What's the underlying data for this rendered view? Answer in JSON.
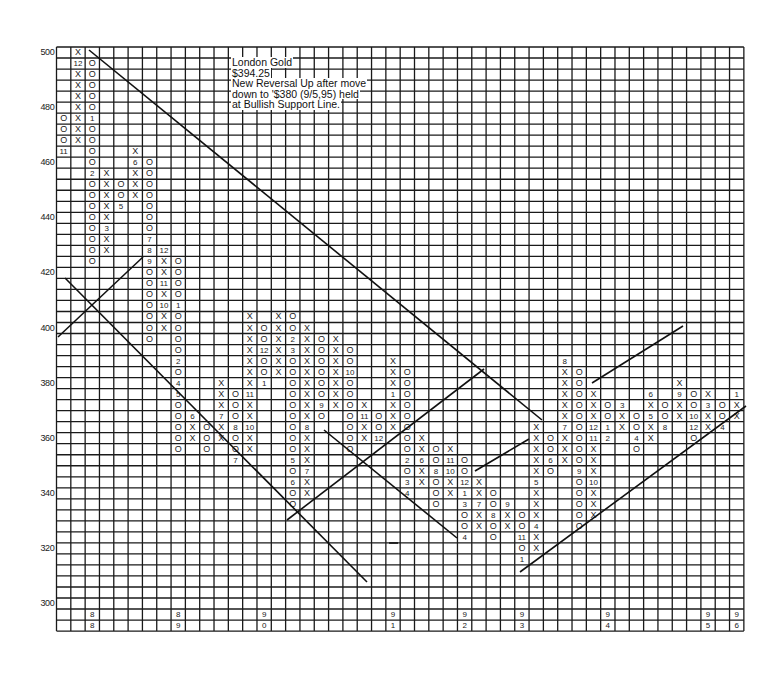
{
  "chart_data": {
    "type": "point-and-figure",
    "title": "London Gold",
    "annotation": {
      "lines": [
        "London Gold",
        "$394.25",
        "New Reversal Up after move",
        "down to '$380 (9/5,95) held",
        "at Bullish Support Line."
      ]
    },
    "box_size": 4,
    "y_axis": {
      "max": 500,
      "min": 300,
      "ticks": [
        {
          "label": "500",
          "row": 0
        },
        {
          "label": "480",
          "row": 5
        },
        {
          "label": "460",
          "row": 10
        },
        {
          "label": "440",
          "row": 15
        },
        {
          "label": "420",
          "row": 20
        },
        {
          "label": "400",
          "row": 25
        },
        {
          "label": "380",
          "row": 30
        },
        {
          "label": "360",
          "row": 35
        },
        {
          "label": "340",
          "row": 40
        },
        {
          "label": "320",
          "row": 45
        },
        {
          "label": "300",
          "row": 50
        }
      ]
    },
    "grid": {
      "columns": 48,
      "rows": 53,
      "grid_on": true
    },
    "year_labels": [
      {
        "col": 2,
        "top": "8",
        "bottom": "8"
      },
      {
        "col": 8,
        "top": "8",
        "bottom": "9"
      },
      {
        "col": 14,
        "top": "9",
        "bottom": "0"
      },
      {
        "col": 23,
        "top": "9",
        "bottom": "1"
      },
      {
        "col": 28,
        "top": "9",
        "bottom": "2"
      },
      {
        "col": 32,
        "top": "9",
        "bottom": "3"
      },
      {
        "col": 38,
        "top": "9",
        "bottom": "4"
      },
      {
        "col": 45,
        "top": "9",
        "bottom": "5"
      },
      {
        "col": 47,
        "top": "9",
        "bottom": "6"
      }
    ],
    "columns": [
      {
        "col": 0,
        "type": "O",
        "start_row": 6,
        "cells": [
          "O",
          "O",
          "O",
          "11"
        ]
      },
      {
        "col": 1,
        "type": "X",
        "start_row": 0,
        "cells": [
          "X",
          "12",
          "X",
          "X",
          "X",
          "X",
          "X",
          "X",
          "X"
        ]
      },
      {
        "col": 2,
        "type": "O",
        "start_row": 1,
        "cells": [
          "O",
          "O",
          "O",
          "O",
          "O",
          "1",
          "O",
          "O",
          "O",
          "O",
          "2",
          "O",
          "O",
          "O",
          "O",
          "O",
          "O",
          "O",
          "O"
        ]
      },
      {
        "col": 3,
        "type": "X",
        "start_row": 11,
        "cells": [
          "X",
          "X",
          "X",
          "X",
          "X",
          "3",
          "X",
          "X"
        ]
      },
      {
        "col": 4,
        "type": "O",
        "start_row": 12,
        "cells": [
          "O",
          "O",
          "5"
        ]
      },
      {
        "col": 5,
        "type": "X",
        "start_row": 9,
        "cells": [
          "X",
          "6",
          "X",
          "X",
          "X"
        ]
      },
      {
        "col": 6,
        "type": "O",
        "start_row": 10,
        "cells": [
          "O",
          "O",
          "O",
          "O",
          "O",
          "O",
          "O",
          "7",
          "8",
          "9",
          "O",
          "O",
          "O",
          "O",
          "O",
          "O",
          "O"
        ]
      },
      {
        "col": 7,
        "type": "X",
        "start_row": 18,
        "cells": [
          "12",
          "X",
          "X",
          "11",
          "X",
          "10",
          "X",
          "X"
        ]
      },
      {
        "col": 8,
        "type": "O",
        "start_row": 19,
        "cells": [
          "O",
          "O",
          "O",
          "O",
          "1",
          "O",
          "O",
          "O",
          "O",
          "2",
          "O",
          "4",
          "5",
          "O",
          "O",
          "O",
          "O",
          "O"
        ]
      },
      {
        "col": 9,
        "type": "X",
        "start_row": 33,
        "cells": [
          "6",
          "X",
          "X"
        ]
      },
      {
        "col": 10,
        "type": "O",
        "start_row": 34,
        "cells": [
          "O",
          "O",
          "O"
        ]
      },
      {
        "col": 11,
        "type": "X",
        "start_row": 30,
        "cells": [
          "X",
          "X",
          "X",
          "7",
          "X",
          "X"
        ]
      },
      {
        "col": 12,
        "type": "O",
        "start_row": 31,
        "cells": [
          "O",
          "O",
          "O",
          "8",
          "O",
          "O",
          "7"
        ]
      },
      {
        "col": 13,
        "type": "X",
        "start_row": 24,
        "cells": [
          "X",
          "X",
          "X",
          "X",
          "X",
          "X",
          "X",
          "11",
          "X",
          "X",
          "10",
          "X",
          "X"
        ]
      },
      {
        "col": 14,
        "type": "O",
        "start_row": 25,
        "cells": [
          "O",
          "O",
          "12",
          "O",
          "O",
          "1"
        ]
      },
      {
        "col": 15,
        "type": "X",
        "start_row": 24,
        "cells": [
          "X",
          "X",
          "X",
          "X",
          "X",
          "X"
        ]
      },
      {
        "col": 16,
        "type": "O",
        "start_row": 24,
        "cells": [
          "O",
          "O",
          "2",
          "3",
          "O",
          "O",
          "O",
          "O",
          "O",
          "O",
          "O",
          "O",
          "O",
          "5",
          "O",
          "6",
          "O",
          "O"
        ]
      },
      {
        "col": 17,
        "type": "X",
        "start_row": 25,
        "cells": [
          "X",
          "X",
          "X",
          "X",
          "X",
          "X",
          "X",
          "X",
          "X",
          "8",
          "X",
          "X",
          "X",
          "7",
          "X",
          "X"
        ]
      },
      {
        "col": 18,
        "type": "O",
        "start_row": 26,
        "cells": [
          "O",
          "O",
          "O",
          "O",
          "O",
          "O",
          "9",
          "O"
        ]
      },
      {
        "col": 19,
        "type": "X",
        "start_row": 26,
        "cells": [
          "X",
          "X",
          "X",
          "X",
          "X",
          "X",
          "X"
        ]
      },
      {
        "col": 20,
        "type": "O",
        "start_row": 27,
        "cells": [
          "O",
          "O",
          "10",
          "O",
          "O",
          "O",
          "O",
          "O",
          "O",
          "O"
        ]
      },
      {
        "col": 21,
        "type": "X",
        "start_row": 32,
        "cells": [
          "X",
          "11",
          "X",
          "X"
        ]
      },
      {
        "col": 22,
        "type": "O",
        "start_row": 33,
        "cells": [
          "O",
          "O",
          "12"
        ]
      },
      {
        "col": 23,
        "type": "X",
        "start_row": 28,
        "cells": [
          "X",
          "X",
          "X",
          "1",
          "X",
          "X",
          "X"
        ]
      },
      {
        "col": 24,
        "type": "O",
        "start_row": 29,
        "cells": [
          "O",
          "O",
          "O",
          "O",
          "O",
          "O",
          "O",
          "O",
          "2",
          "O",
          "3",
          "4"
        ]
      },
      {
        "col": 25,
        "type": "X",
        "start_row": 35,
        "cells": [
          "X",
          "X",
          "6",
          "X",
          "X"
        ]
      },
      {
        "col": 26,
        "type": "O",
        "start_row": 36,
        "cells": [
          "O",
          "O",
          "8",
          "O",
          "O",
          "O"
        ]
      },
      {
        "col": 27,
        "type": "X",
        "start_row": 36,
        "cells": [
          "X",
          "11",
          "10",
          "X",
          "X"
        ]
      },
      {
        "col": 28,
        "type": "O",
        "start_row": 37,
        "cells": [
          "O",
          "O",
          "12",
          "1",
          "3",
          "O",
          "O",
          "4"
        ]
      },
      {
        "col": 29,
        "type": "X",
        "start_row": 39,
        "cells": [
          "X",
          "X",
          "7",
          "X",
          "X"
        ]
      },
      {
        "col": 30,
        "type": "O",
        "start_row": 40,
        "cells": [
          "O",
          "O",
          "8",
          "O",
          "O"
        ]
      },
      {
        "col": 31,
        "type": "X",
        "start_row": 41,
        "cells": [
          "9",
          "X",
          "X"
        ]
      },
      {
        "col": 32,
        "type": "O",
        "start_row": 42,
        "cells": [
          "O",
          "O",
          "11",
          "O",
          "1"
        ]
      },
      {
        "col": 33,
        "type": "X",
        "start_row": 34,
        "cells": [
          "X",
          "X",
          "X",
          "X",
          "X",
          "5",
          "X",
          "X",
          "X",
          "4",
          "X",
          "X"
        ]
      },
      {
        "col": 34,
        "type": "O",
        "start_row": 35,
        "cells": [
          "O",
          "O",
          "6",
          "O"
        ]
      },
      {
        "col": 35,
        "type": "X",
        "start_row": 28,
        "cells": [
          "8",
          "X",
          "X",
          "X",
          "X",
          "X",
          "7",
          "X",
          "X",
          "X"
        ]
      },
      {
        "col": 36,
        "type": "O",
        "start_row": 29,
        "cells": [
          "O",
          "O",
          "O",
          "O",
          "O",
          "O",
          "O",
          "O",
          "O",
          "9",
          "O",
          "O",
          "O",
          "O",
          "O"
        ]
      },
      {
        "col": 37,
        "type": "X",
        "start_row": 31,
        "cells": [
          "X",
          "X",
          "X",
          "12",
          "11",
          "X",
          "X",
          "X",
          "10",
          "X",
          "X",
          "X"
        ]
      },
      {
        "col": 38,
        "type": "O",
        "start_row": 32,
        "cells": [
          "O",
          "O",
          "1",
          "2"
        ]
      },
      {
        "col": 39,
        "type": "X",
        "start_row": 32,
        "cells": [
          "3",
          "X",
          "X"
        ]
      },
      {
        "col": 40,
        "type": "O",
        "start_row": 33,
        "cells": [
          "O",
          "O",
          "4",
          "O"
        ]
      },
      {
        "col": 41,
        "type": "X",
        "start_row": 31,
        "cells": [
          "6",
          "X",
          "5",
          "X",
          "X"
        ]
      },
      {
        "col": 42,
        "type": "O",
        "start_row": 32,
        "cells": [
          "O",
          "O",
          "8"
        ]
      },
      {
        "col": 43,
        "type": "X",
        "start_row": 30,
        "cells": [
          "X",
          "9",
          "X",
          "X"
        ]
      },
      {
        "col": 44,
        "type": "O",
        "start_row": 31,
        "cells": [
          "O",
          "O",
          "10",
          "12",
          "O"
        ]
      },
      {
        "col": 45,
        "type": "X",
        "start_row": 31,
        "cells": [
          "X",
          "3",
          "X",
          "X"
        ]
      },
      {
        "col": 46,
        "type": "O",
        "start_row": 32,
        "cells": [
          "O",
          "O",
          "4"
        ]
      },
      {
        "col": 47,
        "type": "X",
        "start_row": 31,
        "cells": [
          "1",
          "X",
          "X"
        ]
      }
    ],
    "trendlines": [
      {
        "name": "bearish-resistance-line-long",
        "x1": 89,
        "y1": 50,
        "x2": 542,
        "y2": 420
      },
      {
        "name": "bullish-support-line-early",
        "x1": 58,
        "y1": 337,
        "x2": 143,
        "y2": 257
      },
      {
        "name": "bearish-resistance-line-mid",
        "x1": 65,
        "y1": 278,
        "x2": 367,
        "y2": 582
      },
      {
        "name": "bullish-support-line-mid",
        "x1": 287,
        "y1": 520,
        "x2": 484,
        "y2": 369
      },
      {
        "name": "bearish-resistance-line-short",
        "x1": 324,
        "y1": 430,
        "x2": 457,
        "y2": 538
      },
      {
        "name": "bullish-support-line-short",
        "x1": 475,
        "y1": 471,
        "x2": 529,
        "y2": 439
      },
      {
        "name": "bullish-channel-line",
        "x1": 592,
        "y1": 383,
        "x2": 683,
        "y2": 326
      },
      {
        "name": "bullish-support-line-main",
        "x1": 520,
        "y1": 572,
        "x2": 746,
        "y2": 406
      },
      {
        "name": "tick-mark",
        "x1": 389,
        "y1": 543,
        "x2": 398,
        "y2": 543
      }
    ],
    "xlabel": "",
    "ylabel": "",
    "legend": null
  }
}
